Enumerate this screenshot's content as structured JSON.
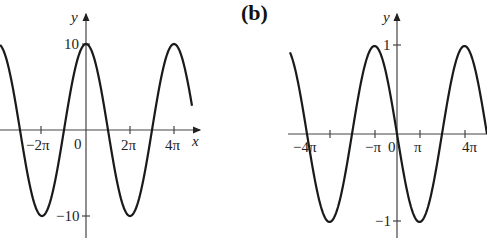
{
  "chart_data": [
    {
      "type": "line",
      "panel_label": "",
      "function": "y = 10 cos(x/2)",
      "xlabel": "x",
      "ylabel": "y",
      "x_tick_labels": [
        "−2π",
        "0",
        "2π",
        "4π"
      ],
      "x_ticks": [
        -6.2832,
        0,
        6.2832,
        12.5664
      ],
      "y_tick_labels": [
        "10",
        "−10"
      ],
      "y_ticks": [
        10,
        -10
      ],
      "xlim": [
        -12.2,
        14.2
      ],
      "ylim": [
        -11,
        11
      ],
      "grid": false,
      "series": [
        {
          "name": "curve",
          "amplitude": 10,
          "period": 12.5664,
          "phase": "cos"
        }
      ]
    },
    {
      "type": "line",
      "panel_label": "(b)",
      "function": "y = −sin(x)",
      "xlabel": "",
      "ylabel": "y",
      "x_tick_labels": [
        "−4π",
        "−π",
        "0",
        "π",
        "4π"
      ],
      "y_tick_labels": [
        "1",
        "−1"
      ],
      "y_ticks": [
        1,
        -1
      ],
      "ylim": [
        -1.1,
        1.1
      ],
      "grid": false,
      "series": [
        {
          "name": "curve",
          "amplitude": 1,
          "phase": "-sin"
        }
      ]
    }
  ],
  "labels": {
    "a": {
      "y": "y",
      "x": "x",
      "zero": "0",
      "neg2pi": "−2π",
      "pos2pi": "2π",
      "pos4pi": "4π",
      "y10": "10",
      "yneg10": "−10"
    },
    "b": {
      "panel": "(b)",
      "y": "y",
      "zero": "0",
      "neg4pi": "−4π",
      "negpi": "−π",
      "pospi": "π",
      "pos4pi": "4π",
      "y1": "1",
      "yneg1": "−1"
    }
  }
}
